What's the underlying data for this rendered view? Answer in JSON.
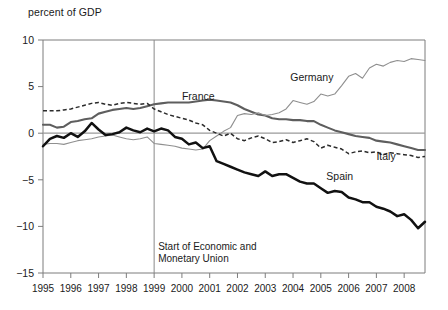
{
  "figure": {
    "axis_title": "percent of GDP",
    "annotation": {
      "line1": "Start of Economic and",
      "line2": "Monetary Union",
      "at_year": 1999
    },
    "labels": {
      "france": "France",
      "germany": "Germany",
      "italy": "Italy",
      "spain": "Spain"
    }
  },
  "chart_data": {
    "type": "line",
    "title": "",
    "subtitle": "",
    "xlabel": "",
    "ylabel": "percent of GDP",
    "xlim": [
      1995,
      2008.75
    ],
    "ylim": [
      -15,
      10
    ],
    "yticks": [
      10,
      5,
      0,
      -5,
      -10,
      -15
    ],
    "ytick_labels": [
      "10",
      "5",
      "0",
      "−5",
      "−10",
      "−15"
    ],
    "xticks": [
      1995,
      1996,
      1997,
      1998,
      1999,
      2000,
      2001,
      2002,
      2003,
      2004,
      2005,
      2006,
      2007,
      2008
    ],
    "xtick_labels": [
      "1995",
      "1996",
      "1997",
      "1998",
      "1999",
      "2000",
      "2001",
      "2002",
      "2003",
      "2004",
      "2005",
      "2006",
      "2007",
      "2008"
    ],
    "grid": false,
    "legend": "inline-annotations",
    "zero_reference_line": 0,
    "vertical_marker": {
      "x": 1999,
      "label": "Start of Economic and Monetary Union"
    },
    "colors": {
      "france": "#5e5e5e",
      "germany": "#8f8f8f",
      "italy": "#2b2b2b",
      "spain": "#111111"
    },
    "line_styles": {
      "france": "solid-medium",
      "germany": "solid-thin",
      "italy": "dashed",
      "spain": "solid-thick"
    },
    "x": [
      1995.0,
      1995.25,
      1995.5,
      1995.75,
      1996.0,
      1996.25,
      1996.5,
      1996.75,
      1997.0,
      1997.25,
      1997.5,
      1997.75,
      1998.0,
      1998.25,
      1998.5,
      1998.75,
      1999.0,
      1999.25,
      1999.5,
      1999.75,
      2000.0,
      2000.25,
      2000.5,
      2000.75,
      2001.0,
      2001.25,
      2001.5,
      2001.75,
      2002.0,
      2002.25,
      2002.5,
      2002.75,
      2003.0,
      2003.25,
      2003.5,
      2003.75,
      2004.0,
      2004.25,
      2004.5,
      2004.75,
      2005.0,
      2005.25,
      2005.5,
      2005.75,
      2006.0,
      2006.25,
      2006.5,
      2006.75,
      2007.0,
      2007.25,
      2007.5,
      2007.75,
      2008.0,
      2008.25,
      2008.5,
      2008.75
    ],
    "series": [
      {
        "name": "France",
        "values": [
          0.9,
          0.9,
          0.6,
          0.7,
          1.2,
          1.3,
          1.5,
          1.6,
          2.1,
          2.3,
          2.5,
          2.6,
          2.7,
          2.6,
          2.7,
          2.9,
          3.1,
          3.2,
          3.3,
          3.3,
          3.3,
          3.3,
          3.4,
          3.5,
          3.6,
          3.5,
          3.4,
          3.3,
          3.0,
          2.6,
          2.3,
          2.0,
          1.9,
          1.6,
          1.5,
          1.5,
          1.4,
          1.4,
          1.3,
          1.3,
          0.9,
          0.6,
          0.3,
          0.1,
          -0.1,
          -0.3,
          -0.4,
          -0.5,
          -0.8,
          -0.9,
          -1.0,
          -1.2,
          -1.4,
          -1.6,
          -1.8,
          -1.8
        ]
      },
      {
        "name": "Germany",
        "values": [
          -1.2,
          -1.1,
          -1.1,
          -1.2,
          -1.0,
          -0.8,
          -0.7,
          -0.6,
          -0.4,
          -0.3,
          -0.2,
          -0.4,
          -0.6,
          -0.7,
          -0.6,
          -0.4,
          -1.1,
          -1.2,
          -1.3,
          -1.4,
          -1.6,
          -1.7,
          -1.8,
          -1.7,
          -0.8,
          -0.3,
          0.2,
          0.6,
          1.9,
          2.1,
          2.0,
          2.2,
          1.9,
          2.0,
          2.2,
          2.6,
          3.5,
          3.3,
          3.1,
          3.4,
          4.2,
          4.0,
          4.2,
          5.1,
          6.1,
          6.4,
          5.9,
          7.0,
          7.4,
          7.2,
          7.6,
          7.8,
          7.7,
          8.0,
          7.9,
          7.8
        ]
      },
      {
        "name": "Italy",
        "values": [
          2.4,
          2.4,
          2.4,
          2.5,
          2.6,
          2.8,
          3.0,
          3.2,
          3.3,
          3.1,
          3.0,
          3.2,
          3.3,
          3.2,
          3.1,
          3.2,
          2.6,
          2.3,
          2.0,
          1.8,
          1.6,
          1.4,
          1.1,
          0.9,
          0.3,
          0.0,
          -0.3,
          0.0,
          -0.6,
          -0.8,
          -0.5,
          -0.3,
          -0.6,
          -1.0,
          -0.9,
          -0.7,
          -1.0,
          -0.8,
          -0.6,
          -0.9,
          -1.6,
          -1.3,
          -1.5,
          -1.7,
          -2.2,
          -2.0,
          -1.9,
          -2.1,
          -2.0,
          -2.3,
          -2.1,
          -2.2,
          -2.3,
          -2.4,
          -2.6,
          -2.5
        ]
      },
      {
        "name": "Spain",
        "values": [
          -1.4,
          -0.6,
          -0.3,
          -0.5,
          0.0,
          -0.4,
          0.2,
          1.1,
          0.4,
          -0.2,
          -0.1,
          0.1,
          0.6,
          0.3,
          0.1,
          0.5,
          0.2,
          0.5,
          0.3,
          -0.4,
          -0.6,
          -1.2,
          -1.0,
          -1.6,
          -1.4,
          -3.0,
          -3.3,
          -3.6,
          -3.9,
          -4.2,
          -4.4,
          -4.6,
          -4.1,
          -4.6,
          -4.4,
          -4.4,
          -4.8,
          -5.2,
          -5.4,
          -5.4,
          -5.9,
          -6.4,
          -6.2,
          -6.3,
          -6.9,
          -7.1,
          -7.4,
          -7.4,
          -7.9,
          -8.1,
          -8.4,
          -8.9,
          -8.7,
          -9.3,
          -10.2,
          -9.5
        ]
      }
    ],
    "annotations": [
      {
        "text": "France",
        "x": 2000.0,
        "y": 3.6
      },
      {
        "text": "Germany",
        "x": 2003.9,
        "y": 5.6
      },
      {
        "text": "Italy",
        "x": 2007.0,
        "y": -2.9
      },
      {
        "text": "Spain",
        "x": 2005.2,
        "y": -5.0
      }
    ]
  }
}
